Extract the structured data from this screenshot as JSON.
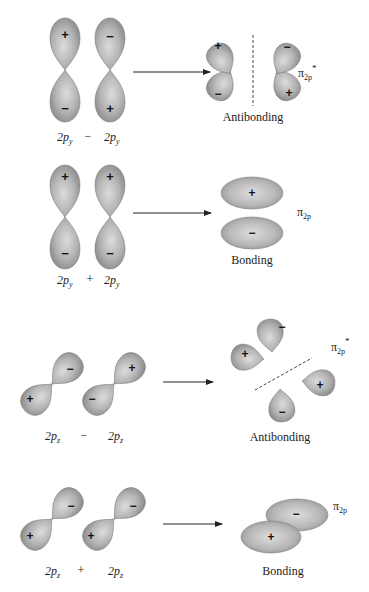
{
  "colors": {
    "lobe_light": "#d4d4d4",
    "lobe_dark": "#8a8a8a",
    "lobe_edge": "#7a7a7a",
    "arrow": "#222222",
    "text": "#222222"
  },
  "panels": [
    {
      "id": "py-minus",
      "combination": {
        "left": "2p",
        "left_sub": "y",
        "operator": "−",
        "right": "2p",
        "right_sub": "y"
      },
      "atomic_signs": {
        "left_top": "+",
        "left_bottom": "−",
        "right_top": "−",
        "right_bottom": "+"
      },
      "result_label": "Antibonding",
      "orbital_symbol": "π",
      "orbital_sub": "2p",
      "orbital_sup": "*",
      "result_signs": [
        "+",
        "−",
        "−",
        "+"
      ]
    },
    {
      "id": "py-plus",
      "combination": {
        "left": "2p",
        "left_sub": "y",
        "operator": "+",
        "right": "2p",
        "right_sub": "y"
      },
      "atomic_signs": {
        "left_top": "+",
        "left_bottom": "−",
        "right_top": "+",
        "right_bottom": "−"
      },
      "result_label": "Bonding",
      "orbital_symbol": "π",
      "orbital_sub": "2p",
      "orbital_sup": "",
      "result_signs": [
        "+",
        "−"
      ]
    },
    {
      "id": "pz-minus",
      "combination": {
        "left": "2p",
        "left_sub": "z",
        "operator": "−",
        "right": "2p",
        "right_sub": "z"
      },
      "atomic_signs": {
        "left_top": "−",
        "left_bottom": "+",
        "right_top": "+",
        "right_bottom": "−"
      },
      "result_label": "Antibonding",
      "orbital_symbol": "π",
      "orbital_sub": "2p",
      "orbital_sup": "*",
      "result_signs": [
        "−",
        "+",
        "+",
        "−"
      ]
    },
    {
      "id": "pz-plus",
      "combination": {
        "left": "2p",
        "left_sub": "z",
        "operator": "+",
        "right": "2p",
        "right_sub": "z"
      },
      "atomic_signs": {
        "left_top": "−",
        "left_bottom": "+",
        "right_top": "−",
        "right_bottom": "+"
      },
      "result_label": "Bonding",
      "orbital_symbol": "π",
      "orbital_sub": "2p",
      "orbital_sup": "",
      "result_signs": [
        "−",
        "+"
      ]
    }
  ]
}
